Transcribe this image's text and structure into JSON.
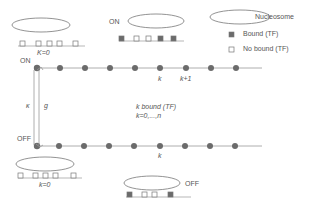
{
  "legend": {
    "nucleosome": "Nucleosome",
    "bound": "Bound (TF)",
    "no_bound": "No bound (TF)"
  },
  "labels": {
    "on_top": "ON",
    "on_left": "ON",
    "off_left": "OFF",
    "off_bottom": "OFF",
    "k0_top": "K=0",
    "k0_bottom": "k=0",
    "kappa": "κ",
    "g": "g",
    "k_top": "k",
    "k_plus_1": "k+1",
    "k_bottom": "k",
    "k_bound": "k bound (TF)",
    "k_range": "k=0,...,n"
  },
  "colors": {
    "line": "#999999",
    "node": "#6b6b6b",
    "bound": "#6b6b6b",
    "unbound": "#ffffff",
    "ellipse": "#777777"
  }
}
